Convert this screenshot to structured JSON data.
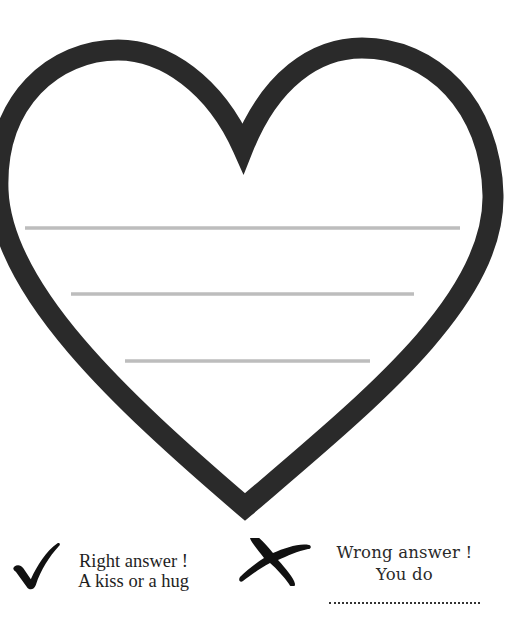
{
  "worksheet": {
    "heart": {
      "outline_color": "#2a2a2a",
      "writing_lines_color": "#bdbdbd",
      "writing_lines": [
        {
          "x1": 25,
          "x2": 460,
          "y": 228
        },
        {
          "x1": 71,
          "x2": 414,
          "y": 294
        },
        {
          "x1": 125,
          "x2": 370,
          "y": 361
        }
      ]
    },
    "right": {
      "icon": "checkmark-icon",
      "line1": "Right answer !",
      "line2": "A kiss or a hug"
    },
    "wrong": {
      "icon": "cross-icon",
      "line1": "Wrong answer !",
      "line2": "You do",
      "blank": ""
    }
  }
}
